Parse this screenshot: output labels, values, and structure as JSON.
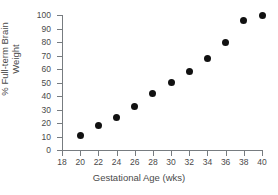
{
  "chart_data": {
    "type": "scatter",
    "title": "",
    "xlabel": "Gestational Age (wks)",
    "ylabel": "% Full-term Brain Weight",
    "ylabel_line1": "% Full-term Brain",
    "ylabel_line2": "Weight",
    "x": [
      20,
      22,
      24,
      26,
      28,
      30,
      32,
      34,
      36,
      38,
      40
    ],
    "values": [
      11,
      18,
      24,
      32,
      42,
      50,
      58,
      68,
      80,
      96,
      100
    ],
    "xlim": [
      18,
      40
    ],
    "ylim": [
      0,
      100
    ],
    "xticks": [
      18,
      20,
      22,
      24,
      26,
      28,
      30,
      32,
      34,
      36,
      38,
      40
    ],
    "yticks": [
      0,
      10,
      20,
      30,
      40,
      50,
      60,
      70,
      80,
      90,
      100
    ],
    "xticklabels": [
      "18",
      "20",
      "22",
      "24",
      "26",
      "28",
      "30",
      "32",
      "34",
      "36",
      "38",
      "40"
    ],
    "yticklabels": [
      "0",
      "10",
      "20",
      "30",
      "40",
      "50",
      "60",
      "70",
      "80",
      "90",
      "100"
    ],
    "grid": false,
    "legend": false,
    "marker": "filled-circle",
    "marker_color": "#111111",
    "axis_color": "#777c80",
    "text_color": "#4a4a4a",
    "background": "#ffffff"
  }
}
